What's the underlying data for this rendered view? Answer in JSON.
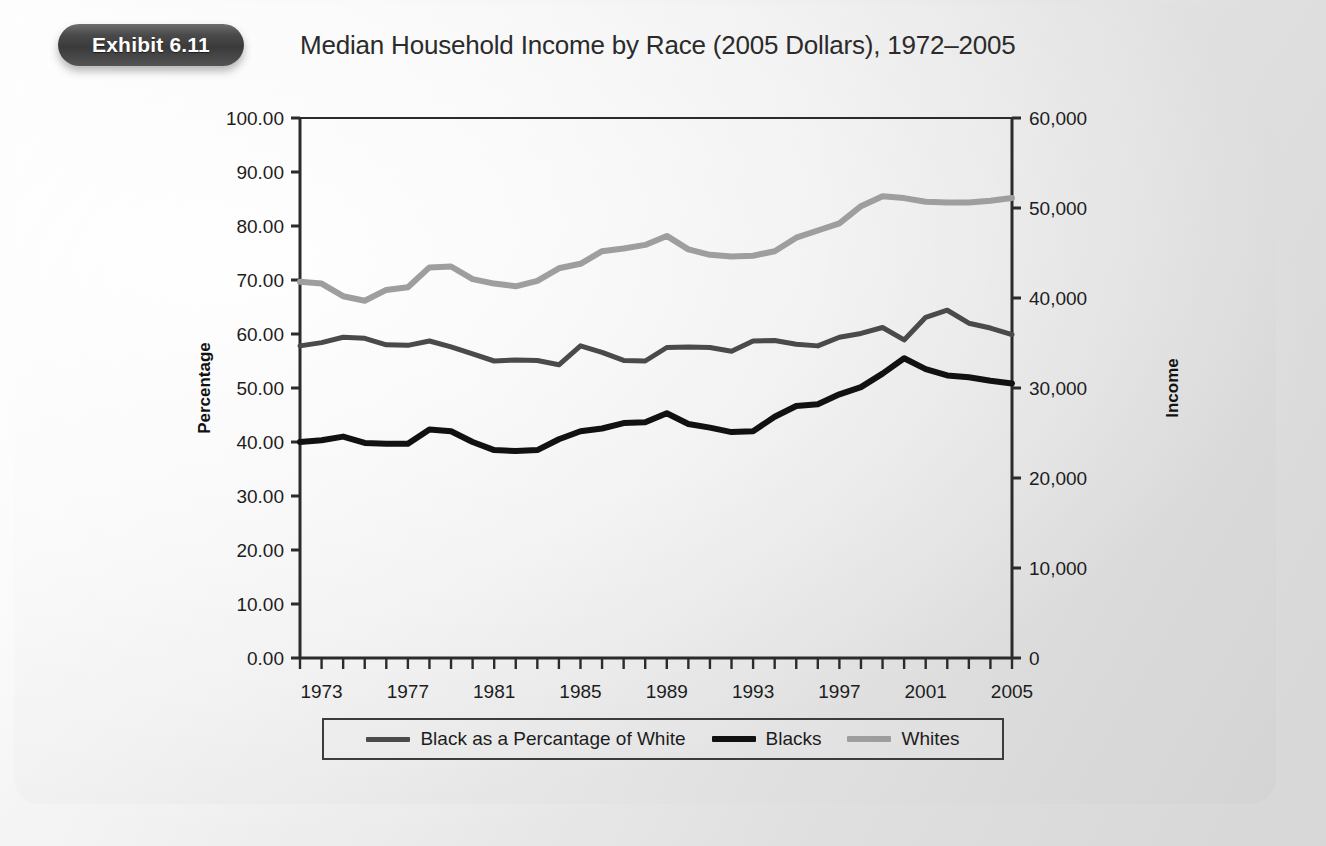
{
  "exhibit": {
    "badge_label": "Exhibit 6.11",
    "title": "Median Household Income by Race (2005 Dollars), 1972–2005"
  },
  "colors": {
    "percentage_line": "#4a4a4a",
    "blacks_line": "#111111",
    "whites_line": "#9e9e9e",
    "axis": "#2b2b2b",
    "panel_bg": "#e6e6e6",
    "badge_bg": "#3a3a3a",
    "title_text": "#2b2b2b"
  },
  "chart_data": {
    "type": "line",
    "title": "Median Household Income by Race (2005 Dollars), 1972–2005",
    "xlabel": "",
    "ylabel": "Percentage",
    "y2label": "Income",
    "grid": false,
    "legend_position": "bottom",
    "xlim": [
      1972,
      2005
    ],
    "ylim": [
      0,
      100
    ],
    "y2lim": [
      0,
      60000
    ],
    "x": [
      1972,
      1973,
      1974,
      1975,
      1976,
      1977,
      1978,
      1979,
      1980,
      1981,
      1982,
      1983,
      1984,
      1985,
      1986,
      1987,
      1988,
      1989,
      1990,
      1991,
      1992,
      1993,
      1994,
      1995,
      1996,
      1997,
      1998,
      1999,
      2000,
      2001,
      2002,
      2003,
      2004,
      2005
    ],
    "xticks": [
      1973,
      1977,
      1981,
      1985,
      1989,
      1993,
      1997,
      2001,
      2005
    ],
    "xtick_labels": [
      "1973",
      "1977",
      "1981",
      "1985",
      "1989",
      "1993",
      "1997",
      "2001",
      "2005"
    ],
    "yticks": [
      0,
      10,
      20,
      30,
      40,
      50,
      60,
      70,
      80,
      90,
      100
    ],
    "ytick_labels": [
      "0.00",
      "10.00",
      "20.00",
      "30.00",
      "40.00",
      "50.00",
      "60.00",
      "70.00",
      "80.00",
      "90.00",
      "100.00"
    ],
    "y2ticks": [
      0,
      10000,
      20000,
      30000,
      40000,
      50000,
      60000
    ],
    "y2tick_labels": [
      "0",
      "10,000",
      "20,000",
      "30,000",
      "40,000",
      "50,000",
      "60,000"
    ],
    "series": [
      {
        "name": "Black as a Percantage of White",
        "axis": "left",
        "unit": "percent",
        "color": "#4a4a4a",
        "width": 5,
        "values": [
          57.8,
          58.4,
          59.4,
          59.2,
          58.0,
          57.9,
          58.7,
          57.6,
          56.3,
          55.0,
          55.2,
          55.1,
          54.3,
          57.8,
          56.6,
          55.1,
          55.0,
          57.5,
          57.6,
          57.5,
          56.8,
          58.7,
          58.8,
          58.1,
          57.8,
          59.4,
          60.1,
          61.2,
          58.9,
          63.1,
          64.4,
          62.0,
          61.1,
          59.9
        ]
      },
      {
        "name": "Blacks",
        "axis": "right",
        "unit": "dollars",
        "color": "#111111",
        "width": 6,
        "values": [
          24000,
          24200,
          24600,
          23900,
          23800,
          23800,
          25400,
          25200,
          24000,
          23100,
          23000,
          23100,
          24300,
          25200,
          25500,
          26100,
          26200,
          27200,
          26000,
          25600,
          25100,
          25200,
          26800,
          28000,
          28200,
          29300,
          30100,
          31600,
          33300,
          32100,
          31400,
          31200,
          30800,
          30500
        ]
      },
      {
        "name": "Whites",
        "axis": "right",
        "unit": "dollars",
        "color": "#9e9e9e",
        "width": 6,
        "values": [
          41800,
          41600,
          40200,
          39700,
          40900,
          41200,
          43400,
          43500,
          42100,
          41600,
          41300,
          41900,
          43300,
          43800,
          45200,
          45500,
          45900,
          46900,
          45400,
          44800,
          44600,
          44700,
          45200,
          46700,
          47500,
          48300,
          50200,
          51300,
          51100,
          50700,
          50600,
          50600,
          50800,
          51100
        ]
      }
    ]
  },
  "axes": {
    "left_title": "Percentage",
    "right_title": "Income"
  },
  "legend": {
    "items": [
      {
        "label": "Black as a Percantage of White",
        "color": "#4a4a4a",
        "thickness": 5
      },
      {
        "label": "Blacks",
        "color": "#111111",
        "thickness": 6
      },
      {
        "label": "Whites",
        "color": "#9e9e9e",
        "thickness": 6
      }
    ]
  }
}
